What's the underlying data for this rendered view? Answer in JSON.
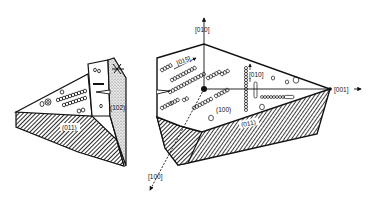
{
  "figure": {
    "left_crystal": {
      "faces": {
        "top_face_label": "",
        "side_face_label": "(102)",
        "bottom_face_label": "(011)"
      }
    },
    "right_crystal": {
      "faces": {
        "main_face_label": "(100)",
        "bottom_face_label": "(011)"
      },
      "axes": {
        "up": "[010]",
        "right": "[001]",
        "down_left": "[100]"
      },
      "annotations": {
        "row_direction": "[015]",
        "vertical_direction": "[010]"
      }
    },
    "colors": {
      "ink": "#111111",
      "background": "#ffffff",
      "stipple": "#bdbdbd"
    }
  }
}
